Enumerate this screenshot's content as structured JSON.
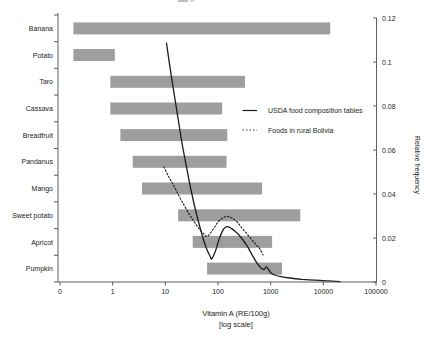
{
  "chart_data": {
    "type": "bar",
    "subtype": "horizontal-range-bars-with-frequency-curves",
    "title": "",
    "xlabel_line1": "Vitamin A (RE/100g)",
    "xlabel_line2": "[log scale]",
    "ylabel_right": "Relative frequency",
    "categories": [
      "Banana",
      "Potato",
      "Taro",
      "Cassava",
      "Breadfruit",
      "Pandanus",
      "Mango",
      "Sweet potato",
      "Apricot",
      "Pumpkin"
    ],
    "bar_ranges": [
      [
        0.18,
        13500
      ],
      [
        0.18,
        1.1
      ],
      [
        0.9,
        325
      ],
      [
        0.9,
        120
      ],
      [
        1.4,
        150
      ],
      [
        2.4,
        145
      ],
      [
        3.6,
        685
      ],
      [
        17.5,
        3650
      ],
      [
        33,
        1060
      ],
      [
        62,
        1640
      ]
    ],
    "x_ticks": {
      "values": [
        0.1,
        1,
        10,
        100,
        1000,
        10000,
        100000
      ],
      "labels": [
        "0",
        "1",
        "10",
        "100",
        "1000",
        "10000",
        "100000"
      ]
    },
    "y_ticks": {
      "values": [
        0,
        0.02,
        0.04,
        0.06,
        0.08,
        0.1,
        0.12
      ],
      "labels": [
        "0",
        "0.02",
        "0.04",
        "0.06",
        "0.08",
        "0.1",
        "0.12"
      ]
    },
    "xlim_log": [
      0.1,
      100000
    ],
    "ylim": [
      0,
      0.12
    ],
    "grid": "off",
    "legend": {
      "position": "center-right",
      "entries": [
        {
          "label": "USDA food composition tables",
          "line": "solid"
        },
        {
          "label": "Foods in rural Bolivia",
          "line": "dotted"
        }
      ]
    },
    "series": [
      {
        "name": "USDA food composition tables",
        "style": "solid",
        "points": [
          [
            10.5,
            0.1086
          ],
          [
            12.3,
            0.0973
          ],
          [
            14.6,
            0.0859
          ],
          [
            17.4,
            0.0745
          ],
          [
            20.7,
            0.0632
          ],
          [
            25.2,
            0.0523
          ],
          [
            30.7,
            0.0418
          ],
          [
            38.2,
            0.0318
          ],
          [
            47.5,
            0.0232
          ],
          [
            59,
            0.0159
          ],
          [
            70.5,
            0.0118
          ],
          [
            76,
            0.0105
          ],
          [
            88,
            0.0136
          ],
          [
            104,
            0.0191
          ],
          [
            124,
            0.0236
          ],
          [
            146,
            0.0252
          ],
          [
            176,
            0.0245
          ],
          [
            220,
            0.0227
          ],
          [
            279,
            0.02
          ],
          [
            356,
            0.0164
          ],
          [
            443,
            0.0123
          ],
          [
            551,
            0.0086
          ],
          [
            656,
            0.0064
          ],
          [
            748,
            0.0057
          ],
          [
            834,
            0.0069
          ],
          [
            910,
            0.0057
          ],
          [
            1016,
            0.0041
          ],
          [
            1210,
            0.0032
          ],
          [
            1570,
            0.0024
          ],
          [
            2330,
            0.0018
          ],
          [
            3940,
            0.0012
          ],
          [
            6950,
            0.0008
          ],
          [
            12270,
            0.0005
          ],
          [
            20700,
            0.0002
          ]
        ]
      },
      {
        "name": "Foods in rural Bolivia",
        "style": "dotted",
        "points": [
          [
            9.4,
            0.0523
          ],
          [
            11.7,
            0.0477
          ],
          [
            14.6,
            0.0436
          ],
          [
            18.2,
            0.0391
          ],
          [
            22.6,
            0.035
          ],
          [
            28.1,
            0.0309
          ],
          [
            33.5,
            0.0282
          ],
          [
            39.9,
            0.0255
          ],
          [
            47.5,
            0.0232
          ],
          [
            55.3,
            0.0216
          ],
          [
            61.8,
            0.0207
          ],
          [
            71.9,
            0.0223
          ],
          [
            83.9,
            0.0245
          ],
          [
            100,
            0.0273
          ],
          [
            119,
            0.0289
          ],
          [
            148,
            0.0298
          ],
          [
            184,
            0.0291
          ],
          [
            230,
            0.0273
          ],
          [
            286,
            0.0245
          ],
          [
            356,
            0.0218
          ],
          [
            432,
            0.0193
          ],
          [
            503,
            0.0175
          ],
          [
            574,
            0.0161
          ],
          [
            627,
            0.015
          ],
          [
            714,
            0.0123
          ]
        ]
      }
    ],
    "colors": {
      "bar": "#9e9e9e",
      "line": "#1c1c1c",
      "axis": "#4d4d4d",
      "text": "#1c1c1c",
      "background": "#ffffff"
    }
  }
}
